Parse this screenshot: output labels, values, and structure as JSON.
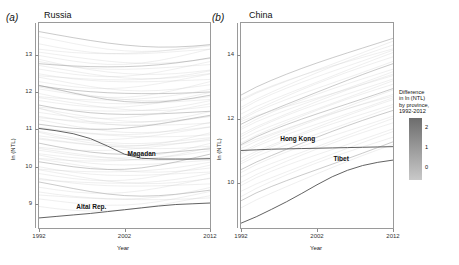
{
  "figure": {
    "panels": [
      {
        "label": "(a)",
        "title": "Russia",
        "ylabel": "ln (NTL)",
        "xlabel": "Year",
        "yticks": [
          "9",
          "10",
          "11",
          "12",
          "13"
        ],
        "xticks": [
          "1992",
          "2002",
          "2012"
        ],
        "annotations": [
          {
            "name": "Magadan",
            "text": "Magadan"
          },
          {
            "name": "Altai Rep.",
            "text": "Altai Rep."
          }
        ]
      },
      {
        "label": "(b)",
        "title": "China",
        "ylabel": "ln (NTL)",
        "xlabel": "Year",
        "yticks": [
          "10",
          "12",
          "14"
        ],
        "xticks": [
          "1992",
          "2002",
          "2012"
        ],
        "annotations": [
          {
            "name": "Hong Kong",
            "text": "Hong Kong"
          },
          {
            "name": "Tibet",
            "text": "Tibet"
          }
        ]
      }
    ]
  },
  "legend": {
    "title": "Difference\nin ln (NTL)\nby province,\n1992-2012",
    "ticks": [
      "2",
      "1",
      "0"
    ],
    "color_high": "#6d6d6d",
    "color_low": "#c9c9c9"
  },
  "chart_data": {
    "type": "line",
    "title": "",
    "xlabel": "Year",
    "ylabel": "ln (NTL)",
    "x": [
      1992,
      1994,
      1996,
      1998,
      2000,
      2002,
      2004,
      2006,
      2008,
      2010,
      2012
    ],
    "panels": [
      {
        "name": "Russia",
        "xlim": [
          1992,
          2012
        ],
        "ylim": [
          8.35,
          13.85
        ],
        "yticks": [
          9,
          10,
          11,
          12,
          13
        ],
        "xticks": [
          1992,
          2002,
          2012
        ],
        "grid": false,
        "note": "Roughly 80 province trajectories, mostly flat-to-declining; two highlighted.",
        "highlighted": [
          {
            "name": "Magadan",
            "values": [
              11.02,
              10.96,
              10.88,
              10.75,
              10.55,
              10.33,
              10.22,
              10.2,
              10.2,
              10.2,
              10.21
            ],
            "label_x": 2004,
            "label_y": 10.24
          },
          {
            "name": "Altai Rep.",
            "values": [
              8.62,
              8.66,
              8.7,
              8.74,
              8.79,
              8.84,
              8.89,
              8.94,
              8.98,
              9.0,
              9.02
            ],
            "label_x": 1998,
            "label_y": 8.8
          }
        ],
        "background_series": [
          {
            "start": 13.62,
            "end": 13.3,
            "dip": 0.22
          },
          {
            "start": 13.45,
            "end": 13.22,
            "dip": 0.2
          },
          {
            "start": 13.3,
            "end": 13.12,
            "dip": 0.18
          },
          {
            "start": 13.18,
            "end": 13.3,
            "dip": 0.24
          },
          {
            "start": 13.05,
            "end": 12.92,
            "dip": 0.2
          },
          {
            "start": 12.95,
            "end": 13.12,
            "dip": 0.26
          },
          {
            "start": 12.84,
            "end": 12.72,
            "dip": 0.18
          },
          {
            "start": 12.78,
            "end": 12.95,
            "dip": 0.22
          },
          {
            "start": 12.68,
            "end": 12.5,
            "dip": 0.2
          },
          {
            "start": 12.6,
            "end": 12.78,
            "dip": 0.24
          },
          {
            "start": 12.52,
            "end": 12.34,
            "dip": 0.18
          },
          {
            "start": 12.44,
            "end": 12.6,
            "dip": 0.22
          },
          {
            "start": 12.36,
            "end": 12.18,
            "dip": 0.2
          },
          {
            "start": 12.28,
            "end": 12.45,
            "dip": 0.24
          },
          {
            "start": 12.2,
            "end": 12.02,
            "dip": 0.18
          },
          {
            "start": 12.12,
            "end": 11.9,
            "dip": 0.22
          },
          {
            "start": 12.05,
            "end": 12.25,
            "dip": 0.26
          },
          {
            "start": 11.98,
            "end": 11.78,
            "dip": 0.2
          },
          {
            "start": 11.9,
            "end": 12.1,
            "dip": 0.24
          },
          {
            "start": 11.82,
            "end": 11.62,
            "dip": 0.18
          },
          {
            "start": 11.75,
            "end": 11.95,
            "dip": 0.22
          },
          {
            "start": 11.68,
            "end": 11.48,
            "dip": 0.2
          },
          {
            "start": 11.6,
            "end": 11.8,
            "dip": 0.24
          },
          {
            "start": 11.52,
            "end": 11.33,
            "dip": 0.18
          },
          {
            "start": 11.45,
            "end": 11.65,
            "dip": 0.22
          },
          {
            "start": 11.38,
            "end": 11.18,
            "dip": 0.2
          },
          {
            "start": 11.3,
            "end": 11.5,
            "dip": 0.24
          },
          {
            "start": 11.22,
            "end": 11.04,
            "dip": 0.18
          },
          {
            "start": 11.15,
            "end": 11.35,
            "dip": 0.22
          },
          {
            "start": 11.08,
            "end": 10.88,
            "dip": 0.2
          },
          {
            "start": 11.0,
            "end": 11.2,
            "dip": 0.24
          },
          {
            "start": 10.92,
            "end": 10.74,
            "dip": 0.18
          },
          {
            "start": 10.85,
            "end": 11.05,
            "dip": 0.22
          },
          {
            "start": 10.78,
            "end": 10.58,
            "dip": 0.2
          },
          {
            "start": 10.7,
            "end": 10.9,
            "dip": 0.24
          },
          {
            "start": 10.62,
            "end": 10.44,
            "dip": 0.18
          },
          {
            "start": 10.55,
            "end": 10.75,
            "dip": 0.22
          },
          {
            "start": 10.48,
            "end": 10.28,
            "dip": 0.2
          },
          {
            "start": 10.4,
            "end": 10.6,
            "dip": 0.24
          },
          {
            "start": 10.32,
            "end": 10.14,
            "dip": 0.18
          },
          {
            "start": 10.25,
            "end": 10.45,
            "dip": 0.22
          },
          {
            "start": 10.18,
            "end": 9.98,
            "dip": 0.2
          },
          {
            "start": 10.1,
            "end": 10.3,
            "dip": 0.24
          },
          {
            "start": 10.02,
            "end": 9.84,
            "dip": 0.18
          },
          {
            "start": 9.95,
            "end": 10.15,
            "dip": 0.22
          },
          {
            "start": 9.88,
            "end": 9.68,
            "dip": 0.2
          },
          {
            "start": 9.8,
            "end": 10.0,
            "dip": 0.24
          },
          {
            "start": 9.72,
            "end": 9.54,
            "dip": 0.18
          },
          {
            "start": 9.65,
            "end": 9.85,
            "dip": 0.22
          },
          {
            "start": 9.55,
            "end": 9.35,
            "dip": 0.2
          },
          {
            "start": 9.45,
            "end": 9.66,
            "dip": 0.24
          },
          {
            "start": 9.35,
            "end": 9.18,
            "dip": 0.18
          },
          {
            "start": 9.22,
            "end": 9.46,
            "dip": 0.22
          },
          {
            "start": 9.1,
            "end": 9.3,
            "dip": 0.2
          },
          {
            "start": 8.95,
            "end": 9.2,
            "dip": 0.24
          },
          {
            "start": 12.9,
            "end": 12.62,
            "dip": 0.3
          },
          {
            "start": 12.15,
            "end": 11.92,
            "dip": 0.28
          },
          {
            "start": 11.55,
            "end": 11.32,
            "dip": 0.3
          },
          {
            "start": 10.95,
            "end": 10.7,
            "dip": 0.28
          },
          {
            "start": 10.35,
            "end": 10.55,
            "dip": 0.3
          }
        ]
      },
      {
        "name": "China",
        "xlim": [
          1992,
          2012
        ],
        "ylim": [
          8.6,
          15.0
        ],
        "yticks": [
          10,
          12,
          14
        ],
        "xticks": [
          1992,
          2002,
          2012
        ],
        "grid": false,
        "note": "Roughly 30 province trajectories, nearly all rising; two highlighted.",
        "highlighted": [
          {
            "name": "Hong Kong",
            "values": [
              11.02,
              11.04,
              11.06,
              11.07,
              11.08,
              11.09,
              11.1,
              11.11,
              11.12,
              11.13,
              11.14
            ],
            "label_x": 1999,
            "label_y": 11.25
          },
          {
            "name": "Tibet",
            "values": [
              8.75,
              8.95,
              9.18,
              9.42,
              9.68,
              9.95,
              10.2,
              10.4,
              10.55,
              10.65,
              10.72
            ],
            "label_x": 2006,
            "label_y": 10.62
          }
        ],
        "background_series": [
          {
            "start": 12.75,
            "end": 14.55
          },
          {
            "start": 12.55,
            "end": 14.42
          },
          {
            "start": 12.4,
            "end": 14.3
          },
          {
            "start": 12.28,
            "end": 14.18
          },
          {
            "start": 12.15,
            "end": 14.05
          },
          {
            "start": 12.05,
            "end": 13.95
          },
          {
            "start": 11.95,
            "end": 13.82
          },
          {
            "start": 11.85,
            "end": 13.7
          },
          {
            "start": 11.75,
            "end": 13.58
          },
          {
            "start": 11.65,
            "end": 13.48
          },
          {
            "start": 11.55,
            "end": 13.38
          },
          {
            "start": 11.45,
            "end": 13.28
          },
          {
            "start": 11.35,
            "end": 13.18
          },
          {
            "start": 11.28,
            "end": 13.08
          },
          {
            "start": 11.18,
            "end": 12.98
          },
          {
            "start": 11.08,
            "end": 12.88
          },
          {
            "start": 10.98,
            "end": 12.78
          },
          {
            "start": 10.88,
            "end": 12.68
          },
          {
            "start": 10.78,
            "end": 12.58
          },
          {
            "start": 10.68,
            "end": 12.48
          },
          {
            "start": 10.58,
            "end": 12.38
          },
          {
            "start": 10.45,
            "end": 12.25
          },
          {
            "start": 10.32,
            "end": 12.12
          },
          {
            "start": 10.18,
            "end": 12.0
          },
          {
            "start": 10.05,
            "end": 11.88
          },
          {
            "start": 9.9,
            "end": 11.72
          },
          {
            "start": 9.75,
            "end": 11.58
          },
          {
            "start": 9.6,
            "end": 11.45
          },
          {
            "start": 9.42,
            "end": 11.3
          },
          {
            "start": 9.25,
            "end": 11.18
          },
          {
            "start": 12.62,
            "end": 14.22
          },
          {
            "start": 11.9,
            "end": 13.35
          },
          {
            "start": 11.2,
            "end": 12.7
          }
        ]
      }
    ]
  }
}
